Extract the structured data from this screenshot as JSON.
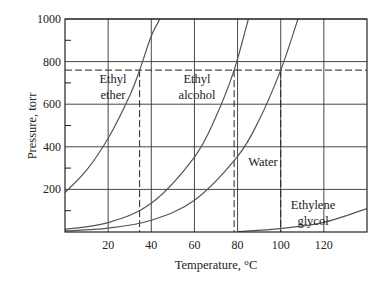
{
  "chart_data": {
    "type": "line",
    "title": "",
    "xlabel": "Temperature, °C",
    "ylabel": "Pressure, torr",
    "xlim": [
      0,
      140
    ],
    "ylim": [
      0,
      1000
    ],
    "grid": true,
    "xticks": [
      20,
      40,
      60,
      80,
      100,
      120
    ],
    "xtick_labels": [
      "20",
      "40",
      "60",
      "80",
      "100",
      "120"
    ],
    "yticks": [
      200,
      400,
      600,
      800,
      1000
    ],
    "ytick_labels": [
      "200",
      "400",
      "600",
      "800",
      "1000"
    ],
    "reference_line": {
      "pressure": 760,
      "style": "dashed"
    },
    "series": [
      {
        "name": "Ethyl ether",
        "label_lines": [
          "Ethyl",
          "ether"
        ],
        "boiling_point": 34.6,
        "x": [
          0,
          10,
          20,
          30,
          34.6,
          40,
          44
        ],
        "y": [
          185,
          290,
          440,
          640,
          760,
          920,
          1000
        ]
      },
      {
        "name": "Ethyl alcohol",
        "label_lines": [
          "Ethyl",
          "alcohol"
        ],
        "boiling_point": 78.4,
        "x": [
          0,
          20,
          40,
          60,
          70,
          78.4,
          85
        ],
        "y": [
          12,
          44,
          135,
          352,
          542,
          760,
          1000
        ]
      },
      {
        "name": "Water",
        "label_lines": [
          "Water"
        ],
        "boiling_point": 100,
        "x": [
          0,
          20,
          40,
          60,
          80,
          90,
          100,
          108
        ],
        "y": [
          5,
          18,
          55,
          149,
          355,
          526,
          760,
          1000
        ]
      },
      {
        "name": "Ethylene glycol",
        "label_lines": [
          "Ethylene",
          "glycol"
        ],
        "boiling_point": 197,
        "x": [
          80,
          100,
          120,
          140
        ],
        "y": [
          2,
          16,
          45,
          110
        ]
      }
    ]
  },
  "labels": {
    "xlabel": "Temperature, °C",
    "ylabel": "Pressure, torr"
  }
}
